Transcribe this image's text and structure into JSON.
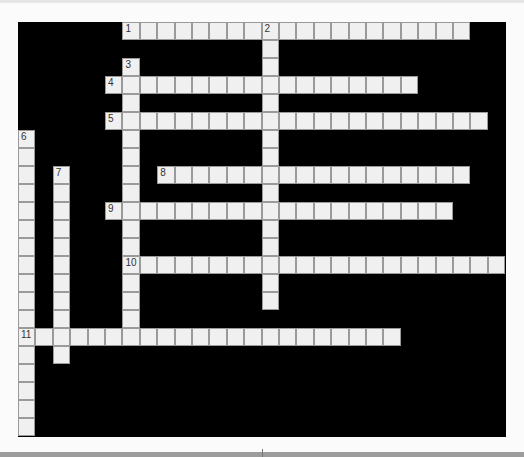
{
  "puzzle": {
    "cell_w": 17.4,
    "cell_h": 18,
    "cols": 28,
    "rows": 23,
    "entries": [
      {
        "number": "1",
        "dir": "across",
        "row": 0,
        "col": 6,
        "length": 20
      },
      {
        "number": "2",
        "dir": "down",
        "row": 0,
        "col": 14,
        "length": 16
      },
      {
        "number": "3",
        "dir": "down",
        "row": 2,
        "col": 6,
        "length": 16
      },
      {
        "number": "4",
        "dir": "across",
        "row": 3,
        "col": 5,
        "length": 18
      },
      {
        "number": "5",
        "dir": "across",
        "row": 5,
        "col": 5,
        "length": 22
      },
      {
        "number": "6",
        "dir": "down",
        "row": 6,
        "col": 0,
        "length": 17
      },
      {
        "number": "7",
        "dir": "down",
        "row": 8,
        "col": 2,
        "length": 11
      },
      {
        "number": "8",
        "dir": "across",
        "row": 8,
        "col": 8,
        "length": 18
      },
      {
        "number": "9",
        "dir": "across",
        "row": 10,
        "col": 5,
        "length": 20
      },
      {
        "number": "10",
        "dir": "across",
        "row": 13,
        "col": 6,
        "length": 22
      },
      {
        "number": "11",
        "dir": "across",
        "row": 17,
        "col": 0,
        "length": 22
      }
    ]
  },
  "colors": {
    "board": "#000000",
    "cell": "#f0f0f0",
    "cell_border": "#9a9a9a"
  }
}
